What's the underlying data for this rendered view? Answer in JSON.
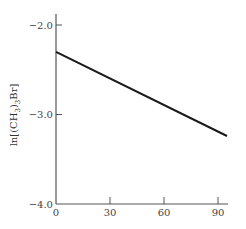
{
  "chart_data": {
    "type": "line",
    "title": "",
    "xlabel": "",
    "ylabel": "ln[(CH3)3Br]",
    "ylabel_parts": {
      "pre": "ln[(CH",
      "sub1": "3",
      "mid": ")",
      "sub2": "3",
      "post": "Br]"
    },
    "xlim": [
      0,
      95
    ],
    "ylim": [
      -4.0,
      -1.9
    ],
    "x_ticks": [
      0,
      30,
      60,
      90
    ],
    "x_tick_labels": [
      "0",
      "30",
      "60",
      "90"
    ],
    "y_ticks": [
      -2.0,
      -3.0,
      -4.0
    ],
    "y_tick_labels": [
      "−2.0",
      "−3.0",
      "−4.0"
    ],
    "grid": false,
    "legend": "none",
    "series": [
      {
        "name": "ln concentration",
        "x": [
          0,
          95
        ],
        "y": [
          -2.3,
          -3.24
        ],
        "color": "#1a1a1a"
      }
    ]
  }
}
